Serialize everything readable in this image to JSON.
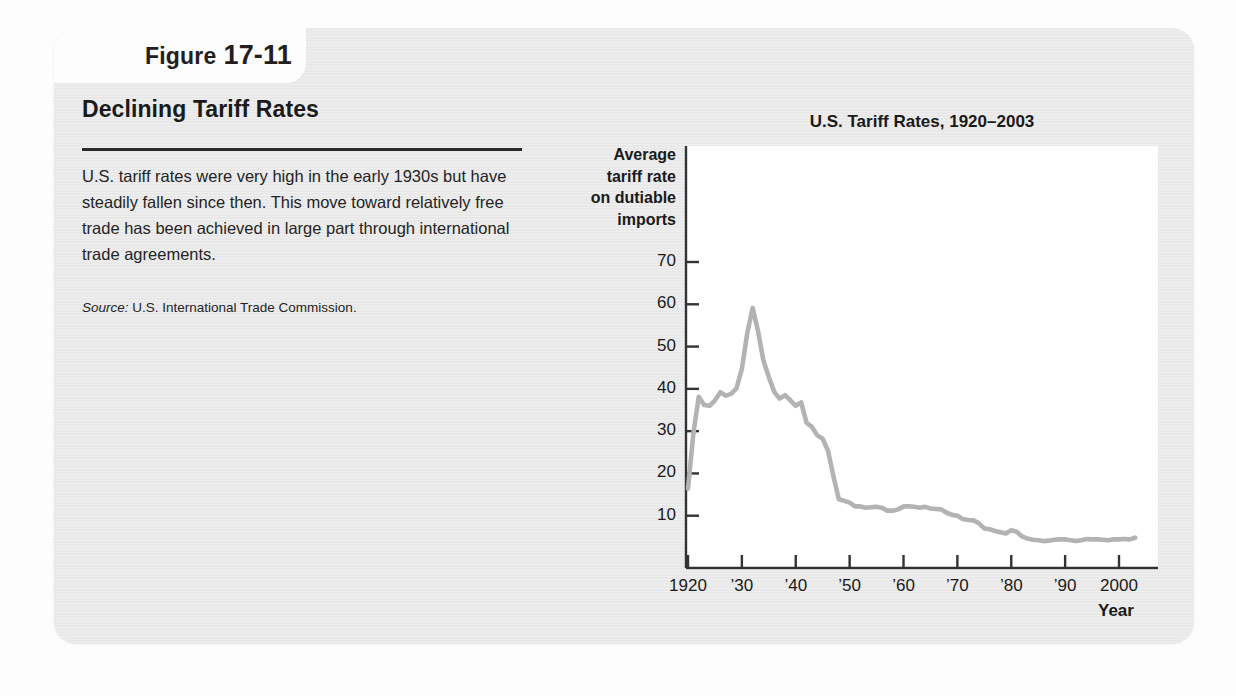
{
  "figure": {
    "tab_word": "Figure",
    "tab_number": "17-11",
    "panel_title": "Declining Tariff Rates",
    "blurb": "U.S. tariff rates were very high in the early 1930s but have steadily fallen since then. This move toward relatively free trade has been achieved in large part through international trade agreements.",
    "source_label": "Source:",
    "source_text": " U.S. International Trade Commission."
  },
  "colors": {
    "card_background": "#e9e9e9",
    "page_background": "#fdfdfd",
    "plot_background": "#ffffff",
    "line": "#b3b3b3",
    "axis": "#333333",
    "text": "#1a1a1a"
  },
  "chart_data": {
    "type": "line",
    "title": "U.S. Tariff Rates, 1920–2003",
    "ylabel": "Average tariff rate on dutiable imports",
    "ylabel_lines": [
      "Average",
      "tariff rate",
      "on dutiable",
      "imports"
    ],
    "xlabel": "Year",
    "xlim": [
      1920,
      2003
    ],
    "ylim": [
      0,
      75
    ],
    "grid": false,
    "legend": null,
    "ytick_values": [
      10,
      20,
      30,
      40,
      50,
      60,
      70
    ],
    "ytick_labels": [
      "10",
      "20",
      "30",
      "40",
      "50",
      "60",
      "70"
    ],
    "xtick_values": [
      1920,
      1930,
      1940,
      1950,
      1960,
      1970,
      1980,
      1990,
      2000
    ],
    "xtick_labels": [
      "1920",
      "’30",
      "’40",
      "’50",
      "’60",
      "’70",
      "’80",
      "’90",
      "2000"
    ],
    "series": [
      {
        "name": "Average tariff rate on dutiable imports",
        "color": "#b3b3b3",
        "x": [
          1920,
          1921,
          1922,
          1923,
          1924,
          1925,
          1926,
          1927,
          1928,
          1929,
          1930,
          1931,
          1932,
          1933,
          1934,
          1935,
          1936,
          1937,
          1938,
          1939,
          1940,
          1941,
          1942,
          1943,
          1944,
          1945,
          1946,
          1947,
          1948,
          1949,
          1950,
          1951,
          1952,
          1953,
          1954,
          1955,
          1956,
          1957,
          1958,
          1959,
          1960,
          1961,
          1962,
          1963,
          1964,
          1965,
          1966,
          1967,
          1968,
          1969,
          1970,
          1971,
          1972,
          1973,
          1974,
          1975,
          1976,
          1977,
          1978,
          1979,
          1980,
          1981,
          1982,
          1983,
          1984,
          1985,
          1986,
          1987,
          1988,
          1989,
          1990,
          1991,
          1992,
          1993,
          1994,
          1995,
          1996,
          1997,
          1998,
          1999,
          2000,
          2001,
          2002,
          2003
        ],
        "y": [
          16.4,
          29.5,
          38.1,
          36.2,
          36.0,
          37.3,
          39.2,
          38.4,
          38.8,
          40.1,
          44.7,
          53.2,
          59.1,
          53.6,
          46.7,
          42.8,
          39.3,
          37.7,
          38.5,
          37.3,
          36.0,
          36.8,
          32.0,
          31.0,
          29.0,
          28.2,
          25.3,
          19.3,
          13.9,
          13.5,
          13.1,
          12.2,
          12.2,
          11.9,
          12.0,
          12.1,
          11.9,
          11.2,
          11.2,
          11.5,
          12.2,
          12.2,
          12.1,
          11.9,
          12.1,
          11.7,
          11.6,
          11.5,
          10.7,
          10.2,
          10.0,
          9.2,
          9.0,
          8.9,
          8.2,
          7.0,
          6.8,
          6.4,
          6.1,
          5.8,
          6.6,
          6.2,
          5.1,
          4.6,
          4.3,
          4.2,
          4.0,
          4.1,
          4.3,
          4.4,
          4.4,
          4.2,
          4.0,
          4.2,
          4.5,
          4.4,
          4.4,
          4.3,
          4.2,
          4.4,
          4.4,
          4.5,
          4.4,
          4.8
        ]
      }
    ]
  }
}
